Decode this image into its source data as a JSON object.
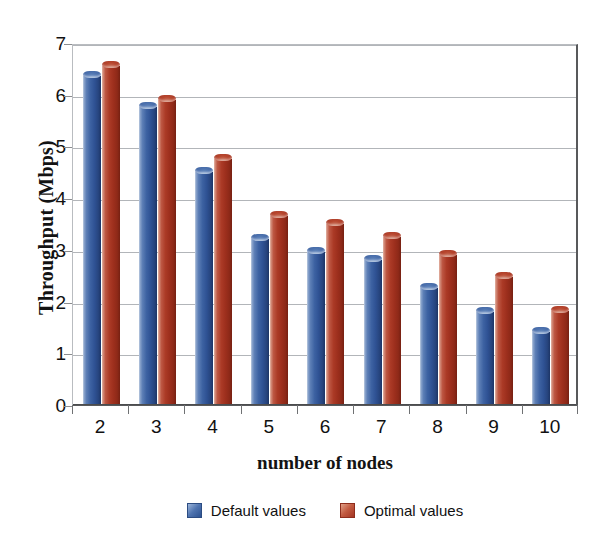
{
  "chart_data": {
    "type": "bar",
    "title": "",
    "xlabel": "number of nodes",
    "ylabel": "Throughput (Mbps)",
    "categories": [
      "2",
      "3",
      "4",
      "5",
      "6",
      "7",
      "8",
      "9",
      "10"
    ],
    "series": [
      {
        "name": "Default values",
        "color": "#3a5f9e",
        "values": [
          6.45,
          5.85,
          4.6,
          3.3,
          3.05,
          2.9,
          2.35,
          1.9,
          1.5
        ]
      },
      {
        "name": "Optimal values",
        "color": "#a8322a",
        "values": [
          6.65,
          6.0,
          4.85,
          3.75,
          3.6,
          3.35,
          3.0,
          2.57,
          1.92
        ]
      }
    ],
    "ylim": [
      0,
      7
    ],
    "yticks": [
      "0",
      "1",
      "2",
      "3",
      "4",
      "5",
      "6",
      "7"
    ],
    "grid": true,
    "legend_position": "bottom"
  },
  "axes": {
    "y_title": "Throughput (Mbps)",
    "x_title": "number of nodes"
  },
  "legend": {
    "entries": [
      {
        "label": "Default values",
        "swatch": "blue-square-icon"
      },
      {
        "label": "Optimal values",
        "swatch": "red-square-icon"
      }
    ]
  }
}
